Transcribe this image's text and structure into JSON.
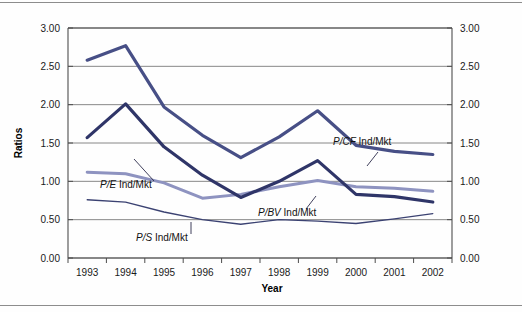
{
  "chart_data": {
    "type": "line",
    "title": "",
    "xlabel": "Year",
    "ylabel": "Ratios",
    "categories": [
      "1993",
      "1994",
      "1995",
      "1996",
      "1997",
      "1998",
      "1999",
      "2000",
      "2001",
      "2002"
    ],
    "ylim": [
      0.0,
      3.0
    ],
    "ytick_labels": [
      "3.00",
      "2.50",
      "2.00",
      "1.50",
      "1.00",
      "0.50",
      "0.00"
    ],
    "ytick_values": [
      3.0,
      2.5,
      2.0,
      1.5,
      1.0,
      0.5,
      0.0
    ],
    "right_axis_tick_labels": [
      "3.00",
      "2.50",
      "2.00",
      "1.50",
      "1.00",
      "0.50",
      "0.00"
    ],
    "grid": true,
    "legend_position": "inline-annotations",
    "series": [
      {
        "name": "P/CF Ind/Mkt",
        "name_italic_part": "P/CF",
        "name_plain_part": " Ind/Mkt",
        "color": "#474f86",
        "width": 3.2,
        "values": [
          2.58,
          2.77,
          1.97,
          1.6,
          1.31,
          1.58,
          1.92,
          1.47,
          1.39,
          1.35
        ]
      },
      {
        "name": "P/E Ind/Mkt",
        "name_italic_part": "P/E",
        "name_plain_part": " Ind/Mkt",
        "color": "#2f3568",
        "width": 3.2,
        "values": [
          1.57,
          2.01,
          1.45,
          1.08,
          0.79,
          1.0,
          1.27,
          0.83,
          0.8,
          0.73
        ]
      },
      {
        "name": "P/BV Ind/Mkt",
        "name_italic_part": "P/BV",
        "name_plain_part": " Ind/Mkt",
        "color": "#8e93c0",
        "width": 3.0,
        "values": [
          1.12,
          1.1,
          0.98,
          0.78,
          0.83,
          0.93,
          1.01,
          0.93,
          0.91,
          0.87
        ]
      },
      {
        "name": "P/S Ind/Mkt",
        "name_italic_part": "P/S",
        "name_plain_part": " Ind/Mkt",
        "color": "#3b4272",
        "width": 1.3,
        "values": [
          0.76,
          0.73,
          0.6,
          0.5,
          0.44,
          0.5,
          0.48,
          0.45,
          0.51,
          0.58
        ]
      }
    ],
    "annotations": [
      {
        "series": "P/CF Ind/Mkt",
        "text_x": 333,
        "text_y": 145,
        "leader": [
          [
            378,
            152
          ],
          [
            367,
            166
          ]
        ],
        "anchor": "start"
      },
      {
        "series": "P/E Ind/Mkt",
        "text_x": 100,
        "text_y": 188,
        "leader": [
          [
            154,
            181
          ],
          [
            134,
            159
          ]
        ],
        "anchor": "start"
      },
      {
        "series": "P/BV Ind/Mkt",
        "text_x": 258,
        "text_y": 216,
        "leader": [
          [
            306,
            209
          ],
          [
            316,
            196
          ]
        ],
        "anchor": "start"
      },
      {
        "series": "P/S Ind/Mkt",
        "text_x": 136,
        "text_y": 241,
        "leader": [
          [
            191,
            234
          ],
          [
            191,
            222
          ]
        ],
        "anchor": "start"
      }
    ]
  }
}
